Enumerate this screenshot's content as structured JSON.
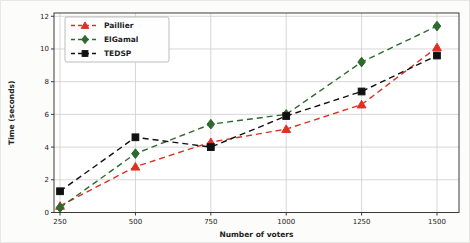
{
  "chart_data": {
    "type": "line",
    "title": "",
    "xlabel": "Number of voters",
    "ylabel": "Time (seconds)",
    "x": [
      250,
      500,
      750,
      1000,
      1250,
      1500
    ],
    "xticks": [
      250,
      500,
      750,
      1000,
      1250,
      1500
    ],
    "yticks": [
      0,
      2,
      4,
      6,
      8,
      10,
      12
    ],
    "ylim": [
      0,
      12.2
    ],
    "xlim": [
      230,
      1573
    ],
    "grid": true,
    "legend_position": "upper-left",
    "series": [
      {
        "name": "Paillier",
        "values": [
          0.4,
          2.8,
          4.3,
          5.1,
          6.6,
          10.1
        ],
        "color": "#dd3222",
        "marker": "triangle",
        "linestyle": "dashed"
      },
      {
        "name": "ElGamal",
        "values": [
          0.3,
          3.6,
          5.4,
          6.0,
          9.2,
          11.4
        ],
        "color": "#2d6a2d",
        "marker": "diamond",
        "linestyle": "dashed"
      },
      {
        "name": "TEDSP",
        "values": [
          1.3,
          4.6,
          4.0,
          5.9,
          7.4,
          9.6
        ],
        "color": "#111111",
        "marker": "square",
        "linestyle": "dashed"
      }
    ]
  },
  "style": {
    "grid_color": "#cdcdcd",
    "spine_color": "#3a3a3a",
    "tick_color": "#222222",
    "plot_bg": "#ffffff",
    "legend_bg": "#fefefe",
    "legend_border": "#bdbdbd"
  }
}
